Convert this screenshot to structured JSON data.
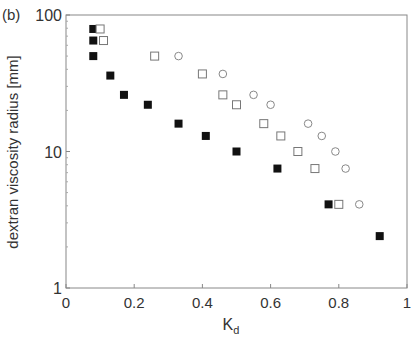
{
  "panel_label": "(b)",
  "chart_data": {
    "type": "scatter",
    "title": "",
    "xlabel": "K",
    "xlabel_sub": "d",
    "ylabel": "dextran viscosity radius [mm]",
    "xlim": [
      0,
      1
    ],
    "ylim": [
      1,
      100
    ],
    "yscale": "log",
    "x_ticks": [
      "0",
      "0.2",
      "0.4",
      "0.6",
      "0.8",
      "1"
    ],
    "y_ticks": [
      "1",
      "10",
      "100"
    ],
    "grid": false,
    "legend": null,
    "series": [
      {
        "name": "filled squares",
        "marker": "square-filled",
        "points": [
          [
            0.08,
            79
          ],
          [
            0.08,
            65
          ],
          [
            0.08,
            50
          ],
          [
            0.13,
            36
          ],
          [
            0.17,
            26
          ],
          [
            0.24,
            22
          ],
          [
            0.33,
            16
          ],
          [
            0.41,
            13
          ],
          [
            0.5,
            10
          ],
          [
            0.62,
            7.5
          ],
          [
            0.77,
            4.1
          ],
          [
            0.92,
            2.4
          ]
        ]
      },
      {
        "name": "open squares",
        "marker": "square-open",
        "points": [
          [
            0.1,
            79
          ],
          [
            0.11,
            65
          ],
          [
            0.26,
            50
          ],
          [
            0.4,
            37
          ],
          [
            0.46,
            26
          ],
          [
            0.5,
            22
          ],
          [
            0.58,
            16
          ],
          [
            0.63,
            13
          ],
          [
            0.68,
            10
          ],
          [
            0.73,
            7.5
          ],
          [
            0.8,
            4.1
          ]
        ]
      },
      {
        "name": "open circles",
        "marker": "circle-open",
        "points": [
          [
            0.33,
            50
          ],
          [
            0.46,
            37
          ],
          [
            0.55,
            26
          ],
          [
            0.6,
            22
          ],
          [
            0.71,
            16
          ],
          [
            0.75,
            13
          ],
          [
            0.79,
            10
          ],
          [
            0.82,
            7.5
          ],
          [
            0.86,
            4.1
          ]
        ]
      }
    ]
  }
}
